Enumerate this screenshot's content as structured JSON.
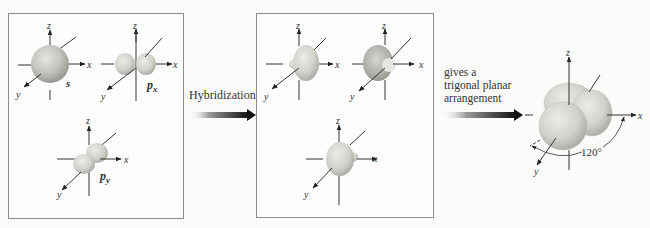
{
  "figure": {
    "left_panel": {
      "orbitals": [
        {
          "name": "s",
          "label": "s",
          "axes": {
            "x": "x",
            "y": "y",
            "z": "z"
          }
        },
        {
          "name": "px",
          "label": "p",
          "subscript": "x",
          "axes": {
            "x": "x",
            "y": "y",
            "z": "z"
          }
        },
        {
          "name": "py",
          "label": "p",
          "subscript": "y",
          "axes": {
            "x": "x",
            "y": "y",
            "z": "z"
          }
        }
      ]
    },
    "hybridization_arrow": {
      "label": "Hybridization"
    },
    "middle_panel": {
      "orbitals": [
        {
          "name": "sp2-1",
          "axes": {
            "x": "x",
            "y": "y",
            "z": "z"
          }
        },
        {
          "name": "sp2-2",
          "axes": {
            "x": "x",
            "y": "y",
            "z": "z"
          }
        },
        {
          "name": "sp2-3",
          "axes": {
            "x": "x",
            "y": "y",
            "z": "z"
          }
        }
      ]
    },
    "result_arrow": {
      "lines": [
        "gives a",
        "trigonal planar",
        "arrangement"
      ]
    },
    "result": {
      "angle_label": "120°",
      "axes": {
        "x": "x",
        "y": "y",
        "z": "z"
      }
    }
  },
  "colors": {
    "orbital_fill": "#d8d8d2",
    "orbital_shade": "#a9a9a4",
    "axis": "#333333",
    "panel_border": "#8d8d8d"
  }
}
